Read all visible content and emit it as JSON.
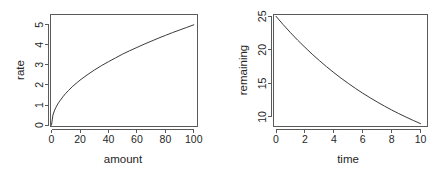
{
  "figure": {
    "layout": "1 row x 2 columns",
    "background": "#ffffff",
    "foreground": "#262626",
    "axis_color": "#5a5a5a",
    "curve_color": "#3a3a3a"
  },
  "chart_data": [
    {
      "type": "line",
      "id": "rate-vs-amount",
      "title": "",
      "xlabel": "amount",
      "ylabel": "rate",
      "xlim": [
        -3,
        103
      ],
      "ylim": [
        -0.15,
        5.15
      ],
      "xticks": [
        0,
        20,
        40,
        60,
        80,
        100
      ],
      "xtick_labels": [
        "0",
        "20",
        "40",
        "60",
        "80",
        "100"
      ],
      "yticks": [
        0,
        1,
        2,
        3,
        4,
        5
      ],
      "ytick_labels": [
        "0",
        "1",
        "2",
        "3",
        "4",
        "5"
      ],
      "grid": false,
      "legend": false,
      "legend_position": "none",
      "series": [
        {
          "name": "rate",
          "formula": "rate = 0.5 * sqrt(amount)",
          "x": [
            0,
            1,
            2,
            3,
            4,
            5,
            6,
            8,
            10,
            12,
            15,
            18,
            20,
            25,
            30,
            35,
            40,
            45,
            50,
            55,
            60,
            65,
            70,
            75,
            80,
            85,
            90,
            95,
            100
          ],
          "y": [
            0,
            0.5,
            0.71,
            0.87,
            1,
            1.12,
            1.22,
            1.41,
            1.58,
            1.73,
            1.94,
            2.12,
            2.24,
            2.5,
            2.74,
            2.96,
            3.16,
            3.35,
            3.54,
            3.71,
            3.87,
            4.03,
            4.18,
            4.33,
            4.47,
            4.61,
            4.74,
            4.87,
            5
          ]
        }
      ]
    },
    {
      "type": "line",
      "id": "remaining-vs-time",
      "title": "",
      "xlabel": "time",
      "ylabel": "remaining",
      "xlim": [
        -0.3,
        10.3
      ],
      "ylim": [
        8.5,
        25.5
      ],
      "xticks": [
        0,
        2,
        4,
        6,
        8,
        10
      ],
      "xtick_labels": [
        "0",
        "2",
        "4",
        "6",
        "8",
        "10"
      ],
      "yticks": [
        10,
        15,
        20,
        25
      ],
      "ytick_labels": [
        "10",
        "15",
        "20",
        "25"
      ],
      "grid": false,
      "legend": false,
      "legend_position": "none",
      "series": [
        {
          "name": "remaining",
          "formula": "remaining = 25 * exp(-0.1022 * time)",
          "x": [
            0,
            0.5,
            1,
            1.5,
            2,
            2.5,
            3,
            3.5,
            4,
            4.5,
            5,
            5.5,
            6,
            6.5,
            7,
            7.5,
            8,
            8.5,
            9,
            9.5,
            10
          ],
          "y": [
            25,
            23.75,
            22.57,
            21.44,
            20.38,
            19.36,
            18.4,
            17.48,
            16.61,
            15.78,
            15,
            14.25,
            13.54,
            12.87,
            12.23,
            11.62,
            11.04,
            10.49,
            9.97,
            9.47,
            9
          ]
        }
      ]
    }
  ]
}
